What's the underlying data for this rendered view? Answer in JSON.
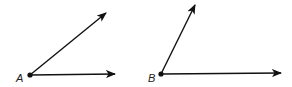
{
  "diagram": {
    "angles": [
      {
        "label": "A",
        "vertex": [
          30,
          75
        ],
        "rays": [
          {
            "name": "upper",
            "tip": [
              106,
              13
            ]
          },
          {
            "name": "lower",
            "tip": [
              115,
              74
            ]
          }
        ],
        "label_pos": [
          16,
          82
        ]
      },
      {
        "label": "B",
        "vertex": [
          161,
          74
        ],
        "rays": [
          {
            "name": "upper",
            "tip": [
              195,
              5
            ]
          },
          {
            "name": "lower",
            "tip": [
              281,
              73
            ]
          }
        ],
        "label_pos": [
          148,
          82
        ]
      }
    ],
    "colors": {
      "stroke": "#111111",
      "background": "#ffffff"
    }
  }
}
